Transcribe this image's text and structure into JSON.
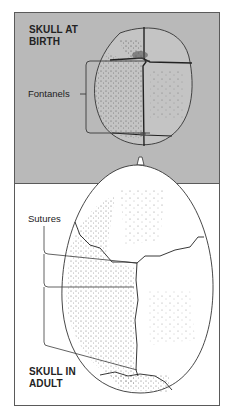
{
  "diagram": {
    "top_panel": {
      "title_line1": "SKULL AT",
      "title_line2": "BIRTH",
      "callout": "Fontanels",
      "background_color": "#b9b9b9"
    },
    "bottom_panel": {
      "title_line1": "SKULL IN",
      "title_line2": "ADULT",
      "callout": "Sutures",
      "background_color": "#ffffff"
    },
    "line_color": "#3a3a3a"
  }
}
